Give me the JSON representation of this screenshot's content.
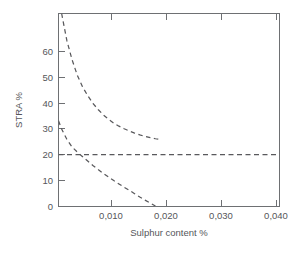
{
  "figure": {
    "background_color": "#ffffff",
    "axis_color": "#6e7073",
    "curve_color": "#59595c",
    "text_color": "#55565a"
  },
  "chart_data": {
    "type": "line",
    "title": "",
    "subtitle": "",
    "xlabel": "Sulphur content %",
    "ylabel": "STRA %",
    "xlim": [
      0.0004,
      0.0428
    ],
    "ylim": [
      0,
      75
    ],
    "xticks": [
      0.01,
      0.02,
      0.03,
      0.04
    ],
    "xtick_labels": [
      "0,010",
      "0,020",
      "0,030",
      "0,040"
    ],
    "yticks": [
      0,
      10,
      20,
      30,
      40,
      50,
      60
    ],
    "ytick_labels": [
      "0",
      "10",
      "20",
      "30",
      "40",
      "50",
      "60"
    ],
    "grid": false,
    "legend": null,
    "frame": "box",
    "linestyle": "dashed",
    "series": [
      {
        "name": "upper-curve",
        "linestyle": "dashed",
        "points": [
          [
            0.001,
            75.0
          ],
          [
            0.002,
            64.5
          ],
          [
            0.003,
            57.0
          ],
          [
            0.004,
            51.0
          ],
          [
            0.005,
            46.5
          ],
          [
            0.006,
            43.0
          ],
          [
            0.007,
            40.0
          ],
          [
            0.008,
            37.6
          ],
          [
            0.009,
            35.5
          ],
          [
            0.01,
            33.8
          ],
          [
            0.011,
            32.3
          ],
          [
            0.012,
            31.1
          ],
          [
            0.013,
            30.1
          ],
          [
            0.014,
            29.2
          ],
          [
            0.015,
            28.4
          ],
          [
            0.016,
            27.7
          ],
          [
            0.017,
            27.1
          ],
          [
            0.018,
            26.6
          ],
          [
            0.019,
            26.2
          ],
          [
            0.02,
            25.9
          ]
        ]
      },
      {
        "name": "lower-curve",
        "linestyle": "dashed",
        "points": [
          [
            0.0004,
            33.2
          ],
          [
            0.001,
            30.0
          ],
          [
            0.002,
            26.0
          ],
          [
            0.003,
            23.0
          ],
          [
            0.004,
            21.0
          ],
          [
            0.0048,
            19.6
          ],
          [
            0.006,
            17.5
          ],
          [
            0.007,
            15.8
          ],
          [
            0.008,
            14.2
          ],
          [
            0.009,
            12.7
          ],
          [
            0.01,
            11.3
          ],
          [
            0.011,
            9.9
          ],
          [
            0.012,
            8.6
          ],
          [
            0.013,
            7.3
          ],
          [
            0.014,
            6.1
          ],
          [
            0.015,
            4.8
          ],
          [
            0.016,
            3.5
          ],
          [
            0.017,
            2.3
          ],
          [
            0.018,
            1.1
          ],
          [
            0.019,
            0.0
          ]
        ]
      },
      {
        "name": "threshold-line",
        "linestyle": "dashed",
        "constant_y": 20,
        "points": [
          [
            0.0004,
            20
          ],
          [
            0.0428,
            20
          ]
        ]
      }
    ]
  }
}
